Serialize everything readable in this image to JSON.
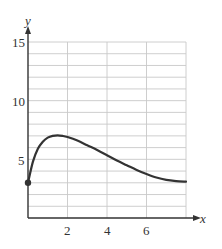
{
  "chart_data": {
    "type": "line",
    "title": "",
    "xlabel": "x",
    "ylabel": "y",
    "xlim": [
      0,
      8
    ],
    "ylim": [
      0,
      15
    ],
    "grid": true,
    "x_ticks": [
      2,
      4,
      6
    ],
    "x_tick_labels": [
      "2",
      "4",
      "6"
    ],
    "y_ticks": [
      5,
      10,
      15
    ],
    "y_tick_labels": [
      "5",
      "10",
      "15"
    ],
    "x_grid_step": 2,
    "y_grid_step": 1,
    "series": [
      {
        "name": "curve",
        "x": [
          0,
          0.25,
          0.5,
          0.75,
          1.0,
          1.25,
          1.5,
          1.75,
          2.0,
          2.5,
          3.0,
          3.5,
          4.0,
          4.5,
          5.0,
          5.5,
          6.0,
          6.5,
          7.0,
          7.5,
          8.0
        ],
        "y": [
          3.0,
          4.8,
          5.9,
          6.5,
          6.85,
          7.0,
          7.05,
          7.0,
          6.9,
          6.6,
          6.2,
          5.8,
          5.35,
          4.9,
          4.5,
          4.1,
          3.75,
          3.45,
          3.25,
          3.15,
          3.1
        ],
        "color": "#333333",
        "start_marker": {
          "x": 0,
          "y": 3,
          "filled": true
        }
      }
    ],
    "legend": null
  },
  "labels": {
    "x_axis": "x",
    "y_axis": "y",
    "x_ticks": [
      "2",
      "4",
      "6"
    ],
    "y_ticks": [
      "5",
      "10",
      "15"
    ]
  }
}
